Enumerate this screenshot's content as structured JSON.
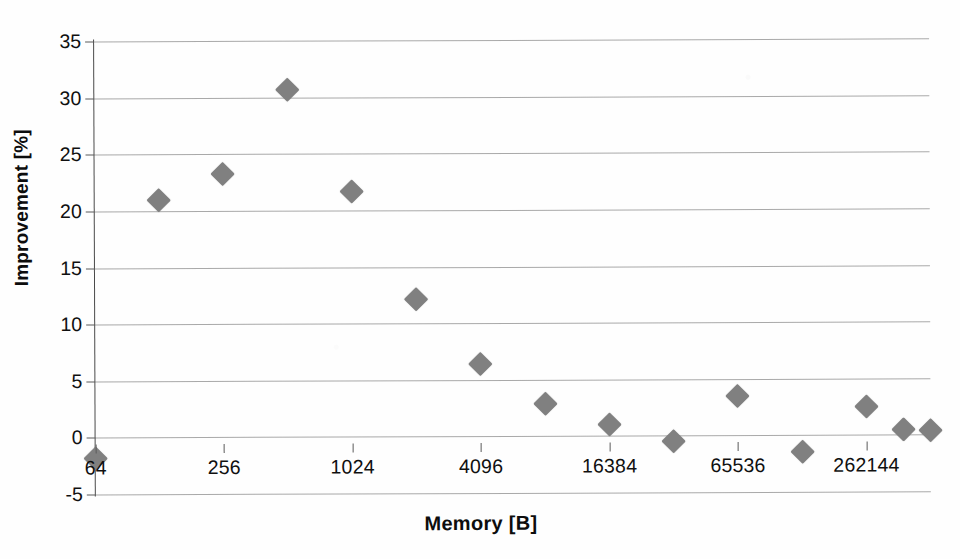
{
  "chart_data": {
    "type": "scatter",
    "title": "",
    "xlabel": "Memory [B]",
    "ylabel": "Improvement [%]",
    "x_scale": "log2",
    "xlim": [
      64,
      524288
    ],
    "ylim": [
      -5,
      35
    ],
    "ytick_values": [
      35,
      30,
      25,
      20,
      15,
      10,
      5,
      0,
      -5
    ],
    "ytick_labels": [
      "35",
      "30",
      "25",
      "20",
      "15",
      "10",
      "5",
      "0",
      "-5"
    ],
    "xtick_values": [
      64,
      256,
      1024,
      4096,
      16384,
      65536,
      262144
    ],
    "xtick_labels": [
      "64",
      "256",
      "1024",
      "4096",
      "16384",
      "65536",
      "262144"
    ],
    "grid": "horizontal",
    "legend": "none",
    "marker": {
      "shape": "diamond",
      "color": "#808080",
      "size": 17
    },
    "series": [
      {
        "name": "Improvement",
        "points": [
          {
            "x": 64,
            "y": -1.8
          },
          {
            "x": 128,
            "y": 21.0
          },
          {
            "x": 256,
            "y": 23.3
          },
          {
            "x": 512,
            "y": 30.7
          },
          {
            "x": 1024,
            "y": 21.7
          },
          {
            "x": 2048,
            "y": 12.1
          },
          {
            "x": 4096,
            "y": 6.4
          },
          {
            "x": 8192,
            "y": 2.9
          },
          {
            "x": 16384,
            "y": 1.0
          },
          {
            "x": 32768,
            "y": -0.5
          },
          {
            "x": 65536,
            "y": 3.5
          },
          {
            "x": 131072,
            "y": -1.5
          },
          {
            "x": 262144,
            "y": 2.5
          },
          {
            "x": 393216,
            "y": 0.5
          },
          {
            "x": 524288,
            "y": 0.35
          }
        ]
      }
    ]
  },
  "colors": {
    "marker": "#808080",
    "gridline": "#9a9a9a",
    "axis": "#4a4a4a",
    "text": "#101010",
    "background": "#fefefe"
  }
}
